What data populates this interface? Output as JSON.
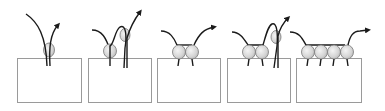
{
  "diagram": {
    "colors": {
      "box_stroke": "#9a9a9a",
      "box_fill": "#ffffff",
      "strand": "#1a1a1a",
      "bead_fill": "#d8d8d8",
      "bead_stroke": "#7a7a7a",
      "background": "#ffffff"
    },
    "panels": [
      {
        "id": 1,
        "box": {
          "x": 17,
          "y": 58,
          "w": 65,
          "h": 45
        },
        "bead_count": 1
      },
      {
        "id": 2,
        "box": {
          "x": 88,
          "y": 58,
          "w": 64,
          "h": 45
        },
        "bead_count": 2
      },
      {
        "id": 3,
        "box": {
          "x": 157,
          "y": 58,
          "w": 64,
          "h": 45
        },
        "bead_count": 2
      },
      {
        "id": 4,
        "box": {
          "x": 227,
          "y": 58,
          "w": 64,
          "h": 45
        },
        "bead_count": 3
      },
      {
        "id": 5,
        "box": {
          "x": 296,
          "y": 58,
          "w": 66,
          "h": 45
        },
        "bead_count": 4
      }
    ]
  }
}
